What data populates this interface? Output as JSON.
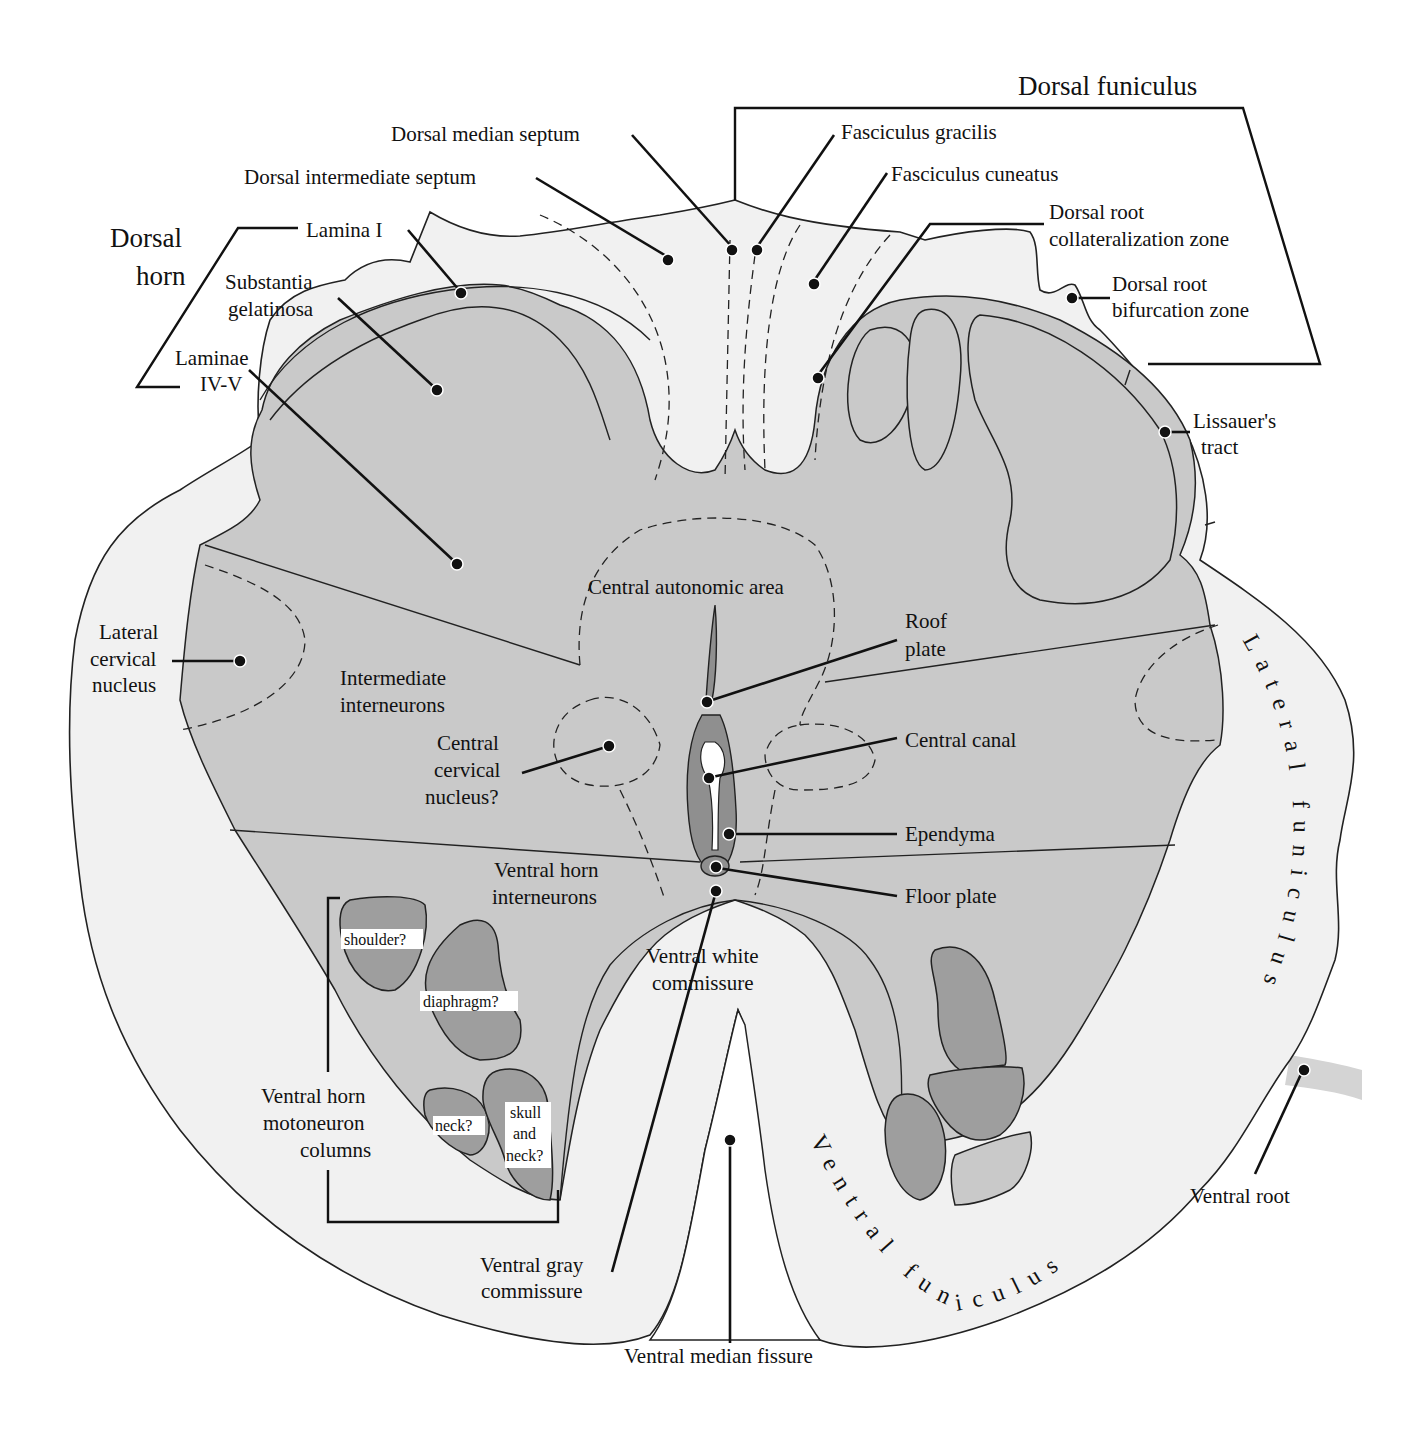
{
  "figure": {
    "colors": {
      "background": "#ffffff",
      "white_matter": "#f1f1f1",
      "gray_matter": "#c9c9c9",
      "motor_column": "#9e9e9e",
      "ependyma": "#8f8f8f",
      "ink": "#111111"
    }
  },
  "group_labels": {
    "dorsal_horn": [
      "Dorsal",
      "horn"
    ],
    "dorsal_funiculus": "Dorsal funiculus",
    "lateral_funiculus": "Lateral funiculus",
    "ventral_funiculus": "Ventral funiculus",
    "ventral_horn_motoneuron_columns": [
      "Ventral horn",
      "motoneuron",
      "columns"
    ]
  },
  "labels": {
    "dorsal_median_septum": "Dorsal median septum",
    "dorsal_intermediate_septum": "Dorsal intermediate septum",
    "lamina_i": "Lamina I",
    "substantia_gelatinosa": [
      "Substantia",
      "gelatinosa"
    ],
    "laminae_iv_v": [
      "Laminae",
      "IV-V"
    ],
    "fasciculus_gracilis": "Fasciculus gracilis",
    "fasciculus_cuneatus": "Fasciculus cuneatus",
    "dorsal_root_collateralization_zone": [
      "Dorsal root",
      "collateralization zone"
    ],
    "dorsal_root_bifurcation_zone": [
      "Dorsal root",
      "bifurcation zone"
    ],
    "lissauers_tract": [
      "Lissauer's",
      "tract"
    ],
    "lateral_cervical_nucleus": [
      "Lateral",
      "cervical",
      "nucleus"
    ],
    "intermediate_interneurons": [
      "Intermediate",
      "interneurons"
    ],
    "central_autonomic_area": "Central autonomic area",
    "roof_plate": [
      "Roof",
      "plate"
    ],
    "central_cervical_nucleus": [
      "Central",
      "cervical",
      "nucleus?"
    ],
    "central_canal": "Central canal",
    "ependyma": "Ependyma",
    "floor_plate": "Floor plate",
    "ventral_horn_interneurons": [
      "Ventral horn",
      "interneurons"
    ],
    "ventral_white_commissure": [
      "Ventral white",
      "commissure"
    ],
    "ventral_gray_commissure": [
      "Ventral gray",
      "commissure"
    ],
    "ventral_median_fissure": "Ventral median fissure",
    "ventral_root": "Ventral root"
  },
  "motoneuron_columns": {
    "shoulder": "shoulder?",
    "diaphragm": "diaphragm?",
    "neck": "neck?",
    "skull_and_neck": [
      "skull",
      "and",
      "neck?"
    ]
  }
}
